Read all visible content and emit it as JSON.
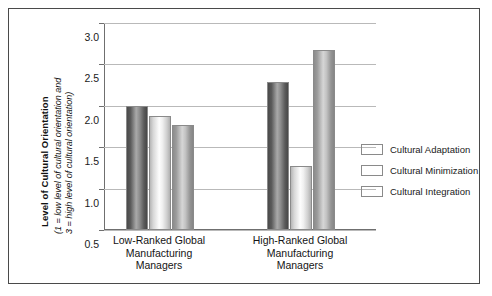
{
  "chart_data": {
    "type": "bar",
    "title": "",
    "ylabel": "Level of Cultural Orientation",
    "ylabel_note_line1": "(1 = low level of cultural orientation and",
    "ylabel_note_line2": "3 = high level of cultural orientation)",
    "xlabel": "",
    "ylim": [
      0.5,
      3.0
    ],
    "ytick_labels": [
      "3.0",
      "2.5",
      "2.0",
      "1.5",
      "1.0",
      "0.5"
    ],
    "ytick_values": [
      3.0,
      2.5,
      2.0,
      1.5,
      1.0,
      0.5
    ],
    "grid": true,
    "legend_position": "right",
    "categories": [
      "Low-Ranked Global Manufacturing Managers",
      "High-Ranked Global Manufacturing Managers"
    ],
    "category_label_lines": [
      [
        "Low-Ranked Global",
        "Manufacturing",
        "Managers"
      ],
      [
        "High-Ranked Global",
        "Manufacturing",
        "Managers"
      ]
    ],
    "series": [
      {
        "name": "Cultural Adaptation",
        "values": [
          2.0,
          2.29
        ],
        "color": "#5a5a5a"
      },
      {
        "name": "Cultural Minimization",
        "values": [
          1.88,
          1.27
        ],
        "color": "#f2f2f2"
      },
      {
        "name": "Cultural Integration",
        "values": [
          1.77,
          2.67
        ],
        "color": "#a8a8a8"
      }
    ]
  },
  "legend": {
    "items": [
      {
        "label": "Cultural Adaptation"
      },
      {
        "label": "Cultural Minimization"
      },
      {
        "label": "Cultural Integration"
      }
    ]
  }
}
